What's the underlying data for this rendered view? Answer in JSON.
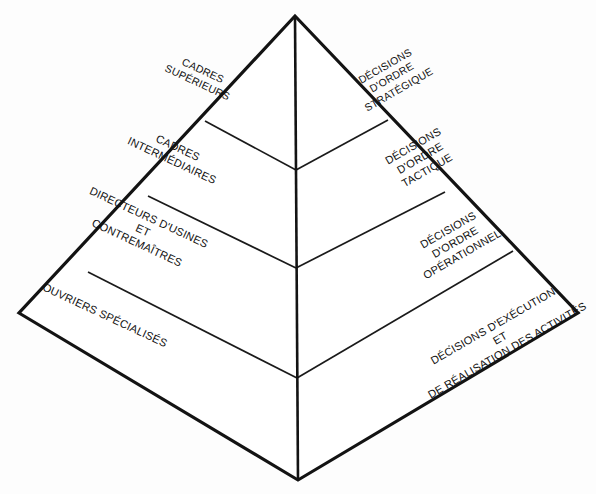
{
  "diagram": {
    "type": "pyramid",
    "background_color": "#ffffff",
    "line_color": "#131313",
    "text_color": "#121212",
    "faces": {
      "left": {
        "name": "Niveaux hiérarchiques",
        "rotation_deg": 25
      },
      "right": {
        "name": "Types de décisions",
        "rotation_deg": -30
      }
    },
    "geometry": {
      "apex": [
        295,
        16
      ],
      "left_corner": [
        19,
        313
      ],
      "right_corner": [
        578,
        313
      ],
      "bottom_vertex": [
        298,
        480
      ]
    },
    "levels": [
      {
        "index": 1,
        "left_face": {
          "lines": [
            "CADRES",
            "SUPÉRIEURS"
          ]
        },
        "right_face": {
          "lines": [
            "DÉCISIONS",
            "D'ORDRE",
            "STRATÉGIQUE"
          ]
        }
      },
      {
        "index": 2,
        "left_face": {
          "lines": [
            "CADRES",
            "INTERMÉDIAIRES"
          ]
        },
        "right_face": {
          "lines": [
            "DÉCISIONS",
            "D'ORDRE",
            "TACTIQUE"
          ]
        }
      },
      {
        "index": 3,
        "left_face": {
          "lines": [
            "DIRECTEURS D'USINES",
            "ET",
            "CONTREMAÎTRES"
          ]
        },
        "right_face": {
          "lines": [
            "DÉCISIONS",
            "D'ORDRE",
            "OPÉRATIONNEL"
          ]
        }
      },
      {
        "index": 4,
        "left_face": {
          "lines": [
            "OUVRIERS SPÉCIALISÉS"
          ]
        },
        "right_face": {
          "lines": [
            "DÉCISIONS D'EXÉCUTION",
            "ET",
            "DE RÉALISATION DES ACTIVITÉS"
          ]
        }
      }
    ]
  }
}
